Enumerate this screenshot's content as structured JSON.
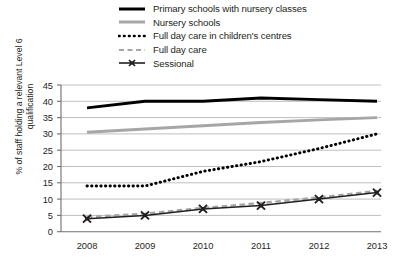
{
  "chart_data": {
    "type": "line",
    "title": "",
    "xlabel": "",
    "ylabel": "% of staff holding a relevant Level 6 qualification",
    "categories": [
      "2008",
      "2009",
      "2010",
      "2011",
      "2012",
      "2013"
    ],
    "x": [
      2008,
      2009,
      2010,
      2011,
      2012,
      2013
    ],
    "ylim": [
      0,
      45
    ],
    "yticks": [
      0,
      5,
      10,
      15,
      20,
      25,
      30,
      35,
      40,
      45
    ],
    "ytick_labels": [
      "0",
      "5",
      "10",
      "15",
      "20",
      "25",
      "30",
      "35",
      "40",
      "45"
    ],
    "grid": "horizontal",
    "legend_position": "top-right",
    "series": [
      {
        "name": "Primary schools with nursery classes",
        "values": [
          38,
          40,
          40,
          41,
          40.5,
          40
        ],
        "style": "solid-thick",
        "color": "#000000",
        "marker": "none"
      },
      {
        "name": "Nursery schools",
        "values": [
          30.5,
          31.5,
          32.5,
          33.5,
          34.3,
          35
        ],
        "style": "solid-thick",
        "color": "#a6a6a6",
        "marker": "none"
      },
      {
        "name": "Full day care in children's centres",
        "values": [
          14,
          14,
          18.5,
          21.5,
          25.5,
          30
        ],
        "style": "dotted",
        "color": "#000000",
        "marker": "none"
      },
      {
        "name": "Full day care",
        "values": [
          4.5,
          5.5,
          7.3,
          8.8,
          10.5,
          12.5
        ],
        "style": "dashed",
        "color": "#a6a6a6",
        "marker": "none"
      },
      {
        "name": "Sessional",
        "values": [
          4,
          5,
          7,
          8,
          10,
          12
        ],
        "style": "solid-thin",
        "color": "#231f20",
        "marker": "x"
      }
    ]
  },
  "legend": {
    "items": [
      {
        "label": "Primary schools with nursery classes",
        "swatch": "solid-thick-black-line-icon"
      },
      {
        "label": "Nursery schools",
        "swatch": "solid-thick-grey-line-icon"
      },
      {
        "label": "Full day care in children's centres",
        "swatch": "dotted-black-line-icon"
      },
      {
        "label": "Full day care",
        "swatch": "dashed-grey-line-icon"
      },
      {
        "label": "Sessional",
        "swatch": "solid-line-with-x-marker-icon"
      }
    ]
  },
  "axes": {
    "y_title": "% of staff holding a relevant Level 6 qualification",
    "y_ticks": [
      "45",
      "40",
      "35",
      "30",
      "25",
      "20",
      "15",
      "10",
      "5",
      "0"
    ],
    "x_ticks": [
      "2008",
      "2009",
      "2010",
      "2011",
      "2012",
      "2013"
    ]
  },
  "colors": {
    "black": "#000000",
    "grey": "#a6a6a6",
    "grid": "#b8b8b8",
    "axis": "#6f6f6f",
    "text": "#231f20"
  }
}
